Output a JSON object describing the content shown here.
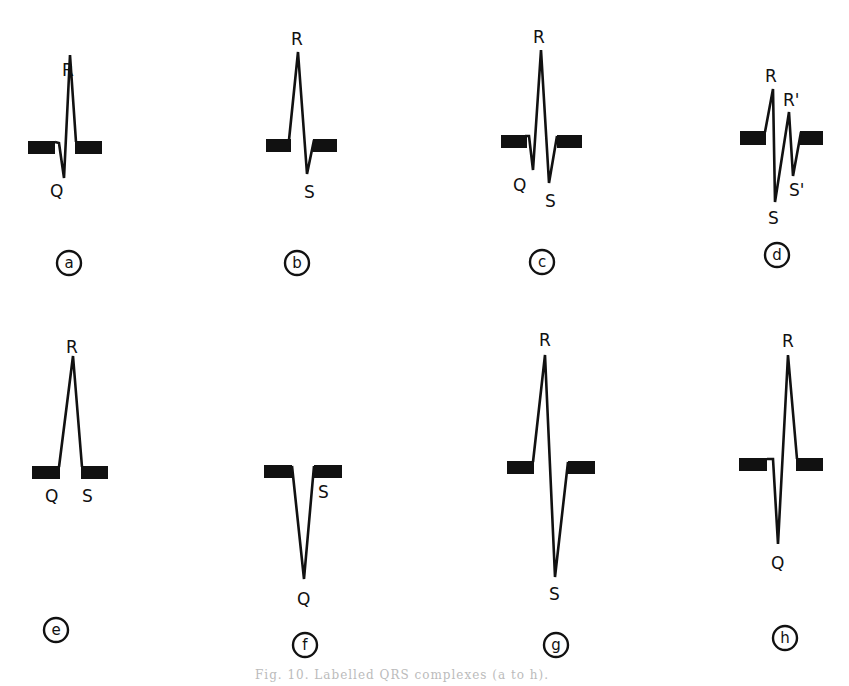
{
  "figure": {
    "caption": "Fig. 10. Labelled QRS complexes (a to h)."
  },
  "panels": [
    {
      "id": "a",
      "label": "a",
      "waves": [
        "R",
        "Q"
      ],
      "description": "qR complex"
    },
    {
      "id": "b",
      "label": "b",
      "waves": [
        "R",
        "S"
      ],
      "description": "Rs complex"
    },
    {
      "id": "c",
      "label": "c",
      "waves": [
        "R",
        "Q",
        "S"
      ],
      "description": "qRs complex"
    },
    {
      "id": "d",
      "label": "d",
      "waves": [
        "R",
        "R'",
        "S",
        "S'"
      ],
      "description": "RsR's' complex"
    },
    {
      "id": "e",
      "label": "e",
      "waves": [
        "R",
        "Q",
        "S"
      ],
      "description": "R complex with Q and S at baseline"
    },
    {
      "id": "f",
      "label": "f",
      "waves": [
        "S",
        "Q"
      ],
      "description": "QS complex"
    },
    {
      "id": "g",
      "label": "g",
      "waves": [
        "R",
        "S"
      ],
      "description": "RS complex"
    },
    {
      "id": "h",
      "label": "h",
      "waves": [
        "R",
        "Q"
      ],
      "description": "qR complex"
    }
  ],
  "labels": {
    "a_R": "R",
    "a_Q": "Q",
    "b_R": "R",
    "b_S": "S",
    "c_R": "R",
    "c_Q": "Q",
    "c_S": "S",
    "d_R": "R",
    "d_R2": "R'",
    "d_S": "S",
    "d_S2": "S'",
    "e_R": "R",
    "e_Q": "Q",
    "e_S": "S",
    "f_S": "S",
    "f_Q": "Q",
    "g_R": "R",
    "g_S": "S",
    "h_R": "R",
    "h_Q": "Q"
  }
}
